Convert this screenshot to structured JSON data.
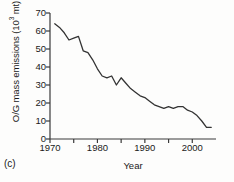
{
  "panel": {
    "label": "(c)"
  },
  "chart_data": {
    "type": "line",
    "title": "",
    "subtitle": "",
    "xlabel": "Year",
    "ylabel": "O/G mass emissions (10³ mt)",
    "ylabel_main": "O/G mass emissions (10",
    "ylabel_sup": "3",
    "ylabel_tail": " mt)",
    "xlim": [
      1970,
      2004
    ],
    "ylim": [
      0,
      70
    ],
    "grid": false,
    "legend": null,
    "legend_position": "none",
    "yticks": [
      70,
      60,
      50,
      40,
      30,
      20,
      10,
      0
    ],
    "ytick_labels": [
      "70",
      "60",
      "50",
      "40",
      "30",
      "20",
      "10",
      "0"
    ],
    "xticks_major": [
      1970,
      1980,
      1990,
      2000
    ],
    "xtick_labels": [
      "1970",
      "1980",
      "1990",
      "2000"
    ],
    "xticks_minor": [
      1975,
      1985,
      1995
    ],
    "line_color": "#333333",
    "x": [
      1971,
      1972,
      1973,
      1974,
      1975,
      1976,
      1977,
      1978,
      1979,
      1980,
      1981,
      1982,
      1983,
      1984,
      1985,
      1986,
      1987,
      1988,
      1989,
      1990,
      1991,
      1992,
      1993,
      1994,
      1995,
      1996,
      1997,
      1998,
      1999,
      2000,
      2001,
      2002,
      2003,
      2004
    ],
    "values": [
      64,
      62,
      59,
      55,
      56,
      57,
      49,
      48,
      44,
      39,
      35,
      34,
      35,
      30,
      34,
      31,
      28,
      26,
      24,
      23,
      21,
      19,
      18,
      17,
      18,
      17,
      18,
      18,
      16,
      15,
      13,
      10,
      6.5,
      6.5
    ],
    "series": [
      {
        "name": "O/G mass emissions",
        "values": [
          64,
          62,
          59,
          55,
          56,
          57,
          49,
          48,
          44,
          39,
          35,
          34,
          35,
          30,
          34,
          31,
          28,
          26,
          24,
          23,
          21,
          19,
          18,
          17,
          18,
          17,
          18,
          18,
          16,
          15,
          13,
          10,
          6.5,
          6.5
        ]
      }
    ]
  }
}
